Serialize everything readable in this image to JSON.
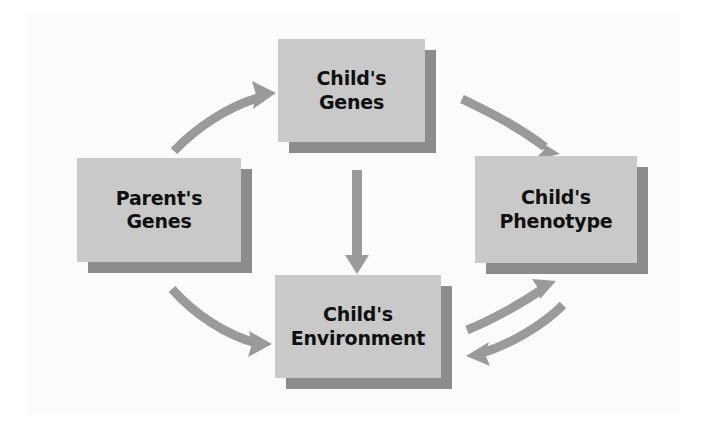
{
  "diagram": {
    "background_color": "#ffffff",
    "panel_color": "#fbfbfb",
    "box_fill_color": "#c9c9c9",
    "box_shadow_color": "#8c8c8c",
    "arrow_color": "#9a9a9a",
    "text_color": "#101010",
    "nodes": [
      {
        "id": "parents-genes",
        "label": "Parent's\nGenes",
        "x": 77,
        "y": 158,
        "width": 164,
        "height": 104,
        "font_size": 19
      },
      {
        "id": "childs-genes",
        "label": "Child's\nGenes",
        "x": 278,
        "y": 39,
        "width": 147,
        "height": 103,
        "font_size": 19
      },
      {
        "id": "childs-phenotype",
        "label": "Child's\nPhenotype",
        "x": 475,
        "y": 156,
        "width": 162,
        "height": 107,
        "font_size": 19
      },
      {
        "id": "childs-environment",
        "label": "Child's\nEnvironment",
        "x": 275,
        "y": 275,
        "width": 166,
        "height": 103,
        "font_size": 19
      }
    ],
    "arrows": [
      {
        "id": "parents-genes-to-childs-genes",
        "from": "parents-genes",
        "to": "childs-genes",
        "style": "curved",
        "direction": "up-right"
      },
      {
        "id": "childs-genes-to-childs-phenotype",
        "from": "childs-genes",
        "to": "childs-phenotype",
        "style": "curved",
        "direction": "down-right"
      },
      {
        "id": "childs-genes-to-childs-environment",
        "from": "childs-genes",
        "to": "childs-environment",
        "style": "straight",
        "direction": "down"
      },
      {
        "id": "parents-genes-to-childs-environment",
        "from": "parents-genes",
        "to": "childs-environment",
        "style": "curved",
        "direction": "down-right"
      },
      {
        "id": "childs-environment-to-childs-phenotype",
        "from": "childs-environment",
        "to": "childs-phenotype",
        "style": "curved",
        "direction": "up-right"
      },
      {
        "id": "childs-phenotype-to-childs-environment",
        "from": "childs-phenotype",
        "to": "childs-environment",
        "style": "curved",
        "direction": "down-left"
      }
    ]
  }
}
